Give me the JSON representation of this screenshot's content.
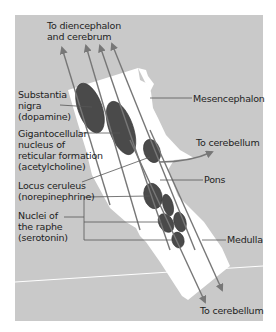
{
  "figure": {
    "background_color": "#c9c9c9",
    "brainstem_color": "#ffffff",
    "nucleus_color": "#4a4a4a",
    "arrow_color": "#777777",
    "labels": {
      "top_arrow": [
        "To diencephalon",
        "and cerebrum"
      ],
      "substantia_nigra": [
        "Substantia",
        "nigra",
        "(dopamine)"
      ],
      "gigantocellular": [
        "Gigantocellular",
        "nucleus of",
        "reticular formation",
        "(acetylcholine)"
      ],
      "locus_ceruleus": [
        "Locus ceruleus",
        "(norepinephrine)"
      ],
      "raphe": [
        "Nuclei of",
        "the raphe",
        "(serotonin)"
      ],
      "mesencephalon": "Mesencephalon",
      "to_cerebellum_mid": "To cerebellum",
      "pons": "Pons",
      "medulla": "Medulla",
      "to_cerebellum_bottom": "To cerebellum"
    }
  }
}
